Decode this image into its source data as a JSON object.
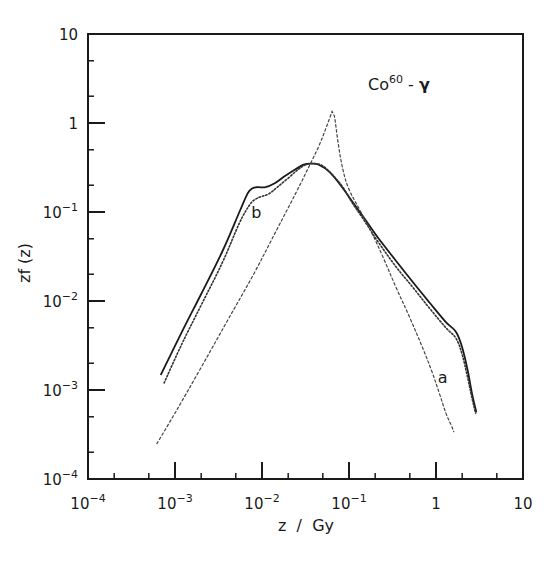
{
  "chart_data": {
    "type": "line",
    "title": "Co60 - γ",
    "title_parts": {
      "base": "Co",
      "sup": "60",
      "rest": " - ",
      "greek": "γ"
    },
    "xlabel": "z  /  Gy",
    "ylabel": "zf (z)",
    "xscale": "log",
    "yscale": "log",
    "xlim": [
      0.0001,
      10
    ],
    "ylim": [
      0.0001,
      10
    ],
    "grid": false,
    "legend": "none (curves labeled inline as 'a' and 'b')",
    "x_ticks": [
      {
        "value": 0.0001,
        "base": "10",
        "exp": "-4"
      },
      {
        "value": 0.001,
        "base": "10",
        "exp": "-3"
      },
      {
        "value": 0.01,
        "base": "10",
        "exp": "-2"
      },
      {
        "value": 0.1,
        "base": "10",
        "exp": "-1"
      },
      {
        "value": 1,
        "base": "1",
        "exp": ""
      },
      {
        "value": 10,
        "base": "10",
        "exp": ""
      }
    ],
    "y_ticks": [
      {
        "value": 10,
        "base": "10",
        "exp": ""
      },
      {
        "value": 1,
        "base": "1",
        "exp": ""
      },
      {
        "value": 0.1,
        "base": "10",
        "exp": "-1"
      },
      {
        "value": 0.01,
        "base": "10",
        "exp": "-2"
      },
      {
        "value": 0.001,
        "base": "10",
        "exp": "-3"
      },
      {
        "value": 0.0001,
        "base": "10",
        "exp": "-4"
      }
    ],
    "annotations": [
      {
        "text": "b",
        "x": 0.0075,
        "y": 0.085
      },
      {
        "text": "a",
        "x": 1.05,
        "y": 0.0012
      }
    ],
    "series": [
      {
        "name": "b (solid)",
        "style": "solid",
        "x": [
          0.00069,
          0.0012,
          0.002,
          0.0035,
          0.0055,
          0.0068,
          0.0078,
          0.009,
          0.011,
          0.014,
          0.018,
          0.024,
          0.03,
          0.036,
          0.045,
          0.06,
          0.08,
          0.11,
          0.15,
          0.22,
          0.35,
          0.55,
          0.85,
          1.3,
          1.7,
          2.0,
          2.3,
          2.6,
          2.9
        ],
        "y": [
          0.0015,
          0.0045,
          0.012,
          0.036,
          0.1,
          0.16,
          0.185,
          0.19,
          0.19,
          0.21,
          0.25,
          0.3,
          0.34,
          0.35,
          0.34,
          0.28,
          0.2,
          0.13,
          0.085,
          0.05,
          0.028,
          0.016,
          0.0095,
          0.0058,
          0.0045,
          0.003,
          0.0017,
          0.0009,
          0.00057
        ]
      },
      {
        "name": "b (dotted)",
        "style": "dotted",
        "x": [
          0.00075,
          0.0012,
          0.002,
          0.0035,
          0.0055,
          0.0072,
          0.0085,
          0.01,
          0.012,
          0.015,
          0.02,
          0.026,
          0.032,
          0.04,
          0.05,
          0.065,
          0.085,
          0.11,
          0.15,
          0.22,
          0.35,
          0.55,
          0.85,
          1.3,
          1.7,
          2.0,
          2.3,
          2.6,
          2.85
        ],
        "y": [
          0.0012,
          0.0033,
          0.009,
          0.027,
          0.075,
          0.12,
          0.14,
          0.15,
          0.16,
          0.19,
          0.24,
          0.3,
          0.34,
          0.35,
          0.33,
          0.26,
          0.19,
          0.125,
          0.08,
          0.045,
          0.024,
          0.014,
          0.0082,
          0.005,
          0.0038,
          0.0025,
          0.0014,
          0.0008,
          0.00055
        ]
      },
      {
        "name": "a (dashed)",
        "style": "dashed",
        "x": [
          0.00062,
          0.001,
          0.002,
          0.004,
          0.008,
          0.015,
          0.025,
          0.035,
          0.045,
          0.055,
          0.064,
          0.068,
          0.075,
          0.085,
          0.1,
          0.13,
          0.18,
          0.25,
          0.35,
          0.5,
          0.7,
          0.9,
          1.1,
          1.3,
          1.5,
          1.6
        ],
        "y": [
          0.00025,
          0.00055,
          0.0018,
          0.006,
          0.02,
          0.065,
          0.17,
          0.33,
          0.55,
          0.9,
          1.35,
          1.2,
          0.6,
          0.3,
          0.18,
          0.11,
          0.06,
          0.03,
          0.014,
          0.0065,
          0.003,
          0.0016,
          0.0009,
          0.00055,
          0.0004,
          0.00034
        ]
      }
    ]
  }
}
